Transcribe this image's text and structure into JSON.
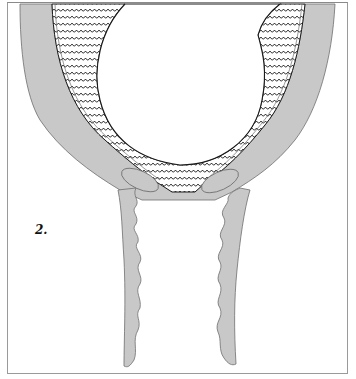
{
  "figure": {
    "label": "2.",
    "colors": {
      "tissue_fill": "#c8c8c8",
      "tissue_stroke": "#6e6e6e",
      "outline": "#222222",
      "background": "#ffffff",
      "frame": "#9a9a9a"
    },
    "parts": [
      {
        "name": "outer-wall",
        "description": "thick gray curved wall forming U shape"
      },
      {
        "name": "scalloped-layer",
        "description": "wavy patterned band lining the inner wall"
      },
      {
        "name": "central-cavity",
        "description": "large round white space"
      },
      {
        "name": "left-canal",
        "description": "descending gray tube with wavy inner edge"
      },
      {
        "name": "right-canal",
        "description": "descending gray tube with wavy inner edge"
      },
      {
        "name": "left-lip",
        "description": "oval gray lobe at base of cavity"
      },
      {
        "name": "right-lip",
        "description": "oval gray lobe at base of cavity"
      }
    ]
  }
}
